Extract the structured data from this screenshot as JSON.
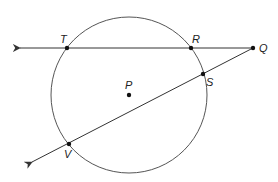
{
  "diagram": {
    "type": "geometry",
    "colors": {
      "stroke": "#333333",
      "point": "#111111",
      "background": "#ffffff"
    },
    "circle": {
      "center_label": "P",
      "cx": 129,
      "cy": 95,
      "r": 78
    },
    "points": {
      "T": {
        "label": "T",
        "x": 67,
        "y": 48
      },
      "R": {
        "label": "R",
        "x": 191,
        "y": 48
      },
      "Q": {
        "label": "Q",
        "x": 253,
        "y": 48
      },
      "S": {
        "label": "S",
        "x": 203,
        "y": 74
      },
      "V": {
        "label": "V",
        "x": 69,
        "y": 144
      },
      "P": {
        "label": "P",
        "x": 129,
        "y": 95
      }
    },
    "lines": [
      {
        "name": "line-QT",
        "through": [
          "Q",
          "R",
          "T"
        ],
        "arrow_end": "left"
      },
      {
        "name": "line-QV",
        "through": [
          "Q",
          "S",
          "V"
        ],
        "arrow_end": "lower-left"
      }
    ]
  }
}
